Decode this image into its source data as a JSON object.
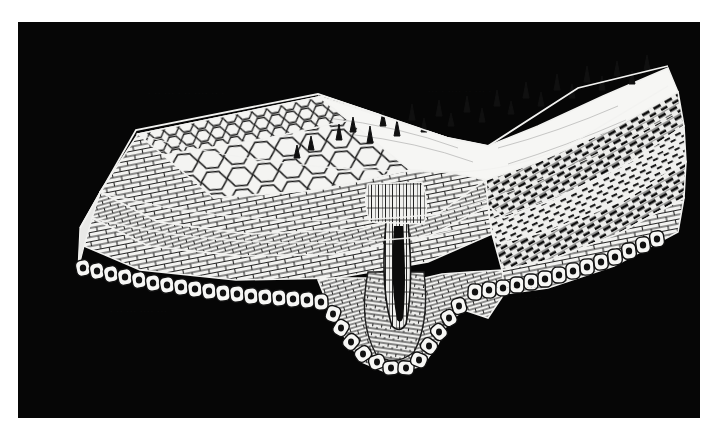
{
  "plate": {
    "figure_kind": "histological-block-diagram",
    "background_color": "#060606",
    "ink_color": "#f2f2f0",
    "line_color": "#1a1a1a",
    "page_color": "#ffffff",
    "plate_rect": {
      "x": 18,
      "y": 22,
      "width": 682,
      "height": 396
    },
    "description": "Three-dimensional cut-block diagram of a layered tissue wall, shown as a white line-drawing reversed out of a solid black field. The slab runs from upper-left down to a deep central invagination and rises again to the right."
  },
  "structures": {
    "surface_epithelium_left": {
      "name": "polygonal surface cell mosaic",
      "note": "Flattened polygonal cells seen in surface view across the upper-left face of the block."
    },
    "surface_projections": {
      "name": "hair-like surface projections",
      "note": "Short tapering spines / villous processes standing up from the luminal surface right of centre.",
      "count_visible": 24
    },
    "fibre_layers": {
      "name": "striated fibre / muscle layers",
      "note": "Dense cross-hatched bands of obliquely cut fibres forming the middle of the wall, heaviest on the right flank."
    },
    "columnar_epithelium": {
      "name": "basal columnar cell row",
      "note": "Single continuous row of rounded nucleated cells lining the whole lower cut margin of the block."
    },
    "invagination": {
      "name": "central crypt / invagination",
      "note": "Deep U-shaped infolding at the centre, lined by concentric layers that follow the fold to a rounded blind base."
    },
    "cut_faces": {
      "name": "cut block faces",
      "note": "Two sectioned end-faces at left and right show the full stratified thickness of the wall."
    }
  },
  "artifacts": {
    "ghost_text": [
      "· ·· ··· · ·· ···· ·· ·",
      "··· · ···· ·· ··· ·",
      "···· ·· ····· ··· ··",
      "·· ··· · ···· ··",
      "· ·· ··· ···· ···"
    ],
    "note": "Faint print-through from the reverse of the page, visible only as smudges in the black field; not legible."
  },
  "labels": {
    "caption": "",
    "figure_number": "",
    "note": "No printed caption, figure number, leader lines or legend text appears anywhere inside this crop."
  }
}
